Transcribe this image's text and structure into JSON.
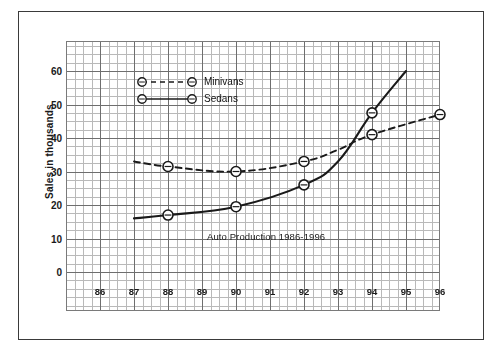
{
  "chart_data": {
    "type": "line",
    "title": "Auto Production 1986-1996",
    "xlabel": "",
    "ylabel": "Sales in thousands",
    "x_tick_labels": [
      "86",
      "87",
      "88",
      "89",
      "90",
      "91",
      "92",
      "93",
      "94",
      "95",
      "96"
    ],
    "y_tick_labels": [
      "0",
      "10",
      "20",
      "30",
      "40",
      "50",
      "60"
    ],
    "xlim": [
      86,
      96
    ],
    "ylim": [
      0,
      65
    ],
    "y_ticks": [
      0,
      10,
      20,
      30,
      40,
      50,
      60
    ],
    "grid": true,
    "legend_position": "upper-left-inside",
    "series": [
      {
        "name": "Minivans",
        "style": "dashed",
        "marker": "circle-open",
        "x": [
          87,
          88,
          90,
          92,
          93,
          94,
          96
        ],
        "values": [
          33,
          31.5,
          30,
          33,
          36.5,
          41,
          47
        ],
        "marker_x": [
          88,
          90,
          92,
          94,
          96
        ],
        "marker_values": [
          31.5,
          30,
          33,
          41,
          47
        ]
      },
      {
        "name": "Sedans",
        "style": "solid",
        "marker": "circle-open",
        "x": [
          87,
          88,
          90,
          92,
          93,
          94,
          95
        ],
        "values": [
          16,
          17,
          19.5,
          26,
          33,
          47.5,
          60
        ],
        "marker_x": [
          88,
          90,
          92,
          94
        ],
        "marker_values": [
          17,
          19.5,
          26,
          47.5
        ]
      }
    ]
  },
  "legend": {
    "items": [
      {
        "label": "Minivans",
        "style": "dashed"
      },
      {
        "label": "Sedans",
        "style": "solid"
      }
    ]
  },
  "colors": {
    "line": "#1a1a1a",
    "grid_minor": "#b9b9b9",
    "grid_major": "#6e6e6e",
    "frame": "#3a3a3a",
    "text": "#1a1a1a",
    "background": "#ffffff"
  }
}
